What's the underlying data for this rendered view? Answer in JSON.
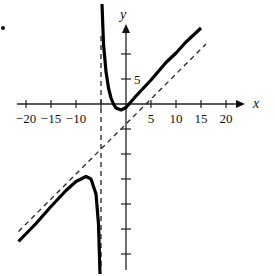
{
  "chart_data": {
    "type": "line",
    "title": "",
    "xlabel": "x",
    "ylabel": "y",
    "xlim": [
      -22,
      24
    ],
    "ylim": [
      -34,
      20
    ],
    "grid": false,
    "legend": null,
    "x_ticks": [
      -20,
      -15,
      -10,
      -5,
      5,
      10,
      15,
      20
    ],
    "x_tick_labels": [
      "-20",
      "-15",
      "-10",
      "",
      "5",
      "10",
      "15",
      "20"
    ],
    "y_ticks": [
      10,
      5,
      -5,
      -10,
      -15,
      -20,
      -25,
      -30
    ],
    "y_tick_labels": [
      "",
      "5",
      "",
      "",
      "",
      "",
      "",
      ""
    ],
    "asymptotes": {
      "vertical": {
        "x": -5,
        "style": "dashed"
      },
      "slant": {
        "equation": "y = x - 4",
        "style": "dashed"
      }
    },
    "series": [
      {
        "name": "right branch",
        "style": "solid-thick",
        "x": [
          -4.8,
          -4.5,
          -4,
          -3.5,
          -3,
          -2.5,
          -2,
          -1,
          0,
          2,
          5,
          8,
          10,
          12,
          15
        ],
        "y": [
          20,
          12,
          6.5,
          3.2,
          1.2,
          0,
          -0.8,
          -1.2,
          -0.7,
          1.6,
          4.8,
          8.3,
          10.2,
          12.4,
          15.2
        ]
      },
      {
        "name": "left branch",
        "style": "solid-thick",
        "x": [
          -21.5,
          -18,
          -15,
          -12,
          -10,
          -8,
          -7,
          -6,
          -5.5,
          -5.2
        ],
        "y": [
          -27.5,
          -23.9,
          -20.5,
          -17.3,
          -15.5,
          -14.5,
          -15,
          -18,
          -24,
          -34
        ]
      }
    ]
  },
  "axes": {
    "x_label": "x",
    "y_label": "y"
  }
}
